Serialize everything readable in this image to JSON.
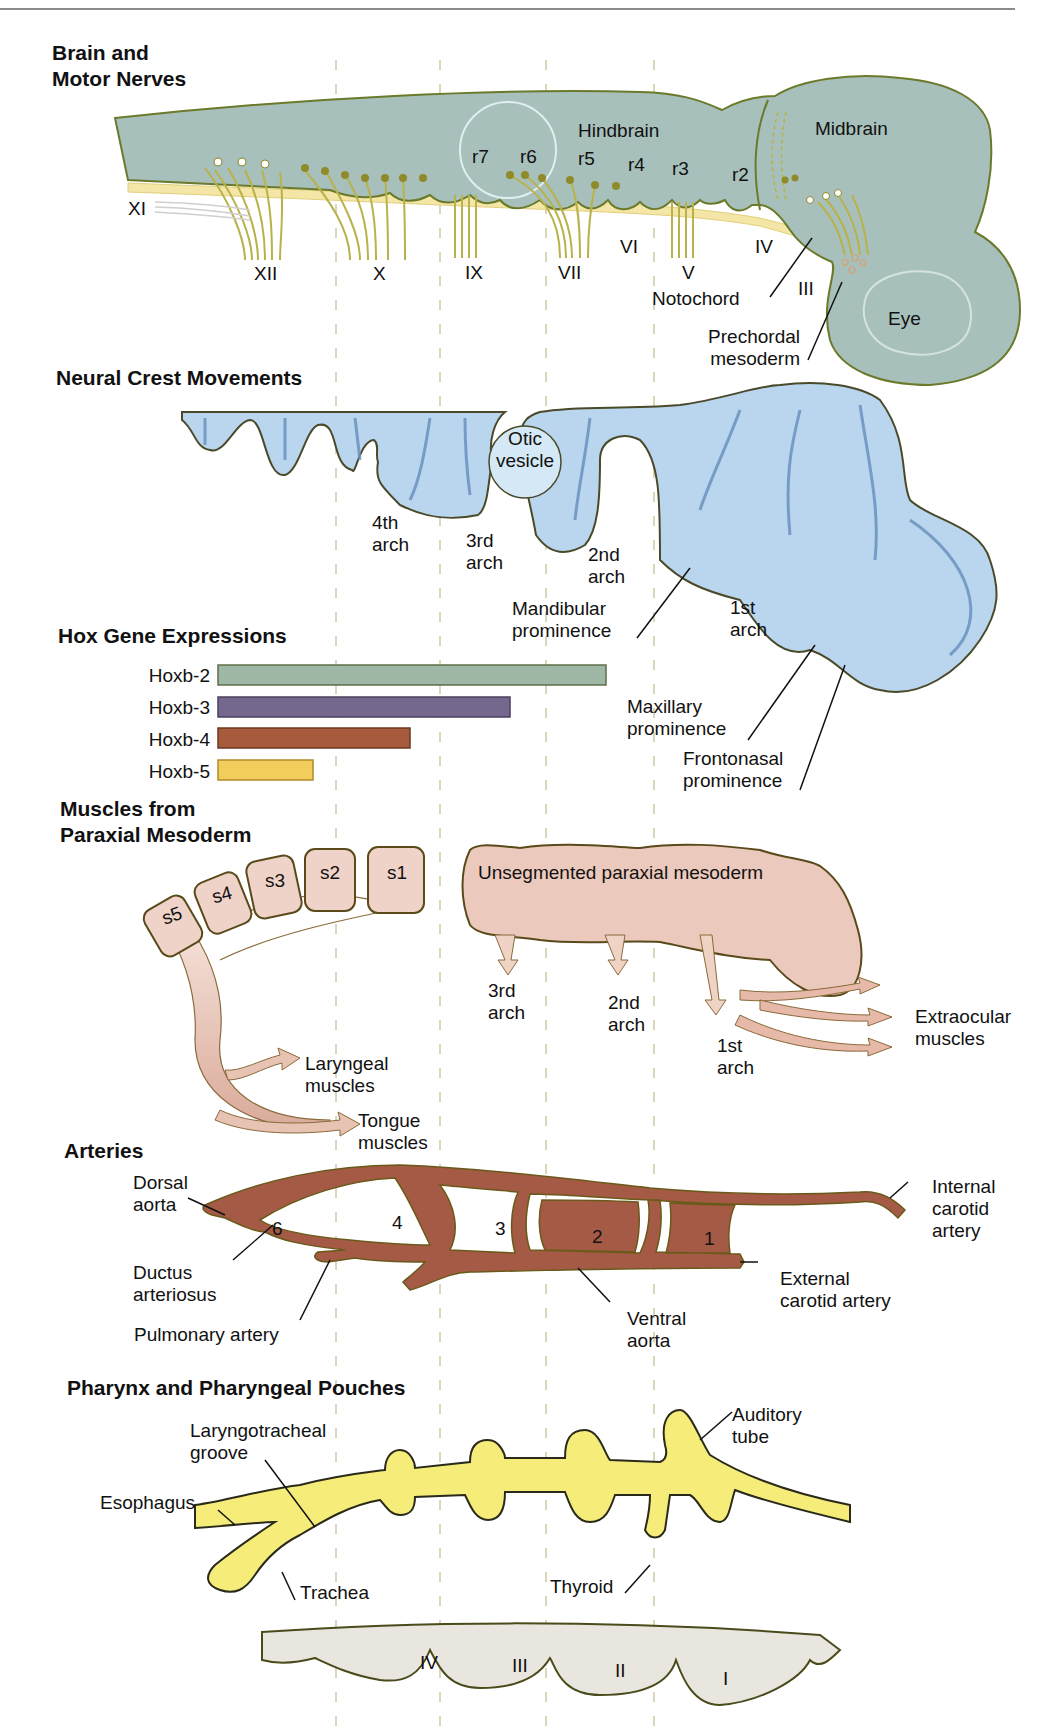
{
  "colors": {
    "brain": "#a8c0bb",
    "brain_outline": "#6a7a2a",
    "nerve": "#b9b24a",
    "notochord": "#f3e6a6",
    "neural_crest": "#b9d6ee",
    "neural_crest_arrow": "#7fa9d6",
    "mesoderm": "#ecc9bd",
    "artery": "#a45a45",
    "pharynx": "#f5ec7a",
    "ectoderm": "#e9e6df",
    "guide_line": "#c9c3a0",
    "hox_b2": "#9fb8a6",
    "hox_b3": "#75688f",
    "hox_b4": "#a85a3c",
    "hox_b5": "#f1cd5c"
  },
  "sections": {
    "brain": {
      "title_line1": "Brain and",
      "title_line2": "Motor Nerves",
      "hindbrain": "Hindbrain",
      "midbrain": "Midbrain",
      "eye": "Eye",
      "rhombomeres": [
        "r7",
        "r6",
        "r5",
        "r4",
        "r3",
        "r2"
      ],
      "nerves": [
        "XI",
        "XII",
        "X",
        "IX",
        "VII",
        "VI",
        "V",
        "IV",
        "III"
      ],
      "notochord": "Notochord",
      "prechordal_line1": "Prechordal",
      "prechordal_line2": "mesoderm"
    },
    "neural_crest": {
      "title": "Neural Crest Movements",
      "otic_line1": "Otic",
      "otic_line2": "vesicle",
      "arch4_line1": "4th",
      "arch4_line2": "arch",
      "arch3_line1": "3rd",
      "arch3_line2": "arch",
      "arch2_line1": "2nd",
      "arch2_line2": "arch",
      "arch1_line1": "1st",
      "arch1_line2": "arch",
      "mandibular_line1": "Mandibular",
      "mandibular_line2": "prominence",
      "maxillary_line1": "Maxillary",
      "maxillary_line2": "prominence",
      "frontonasal_line1": "Frontonasal",
      "frontonasal_line2": "prominence"
    },
    "hox": {
      "title": "Hox Gene Expressions",
      "genes": [
        {
          "name": "Hoxb-2",
          "start_x": 218,
          "end_x": 606
        },
        {
          "name": "Hoxb-3",
          "start_x": 218,
          "end_x": 510
        },
        {
          "name": "Hoxb-4",
          "start_x": 218,
          "end_x": 410
        },
        {
          "name": "Hoxb-5",
          "start_x": 218,
          "end_x": 313
        }
      ]
    },
    "muscles": {
      "title_line1": "Muscles from",
      "title_line2": "Paraxial Mesoderm",
      "somites": [
        "s5",
        "s4",
        "s3",
        "s2",
        "s1"
      ],
      "unsegmented": "Unsegmented paraxial mesoderm",
      "arch3_line1": "3rd",
      "arch3_line2": "arch",
      "arch2_line1": "2nd",
      "arch2_line2": "arch",
      "arch1_line1": "1st",
      "arch1_line2": "arch",
      "laryngeal_line1": "Laryngeal",
      "laryngeal_line2": "muscles",
      "tongue_line1": "Tongue",
      "tongue_line2": "muscles",
      "extraocular_line1": "Extraocular",
      "extraocular_line2": "muscles"
    },
    "arteries": {
      "title": "Arteries",
      "dorsal_line1": "Dorsal",
      "dorsal_line2": "aorta",
      "ductus_line1": "Ductus",
      "ductus_line2": "arteriosus",
      "pulmonary": "Pulmonary artery",
      "arch_numbers": [
        "6",
        "4",
        "3",
        "2",
        "1"
      ],
      "ventral_line1": "Ventral",
      "ventral_line2": "aorta",
      "external_line1": "External",
      "external_line2": "carotid artery",
      "internal_line1": "Internal",
      "internal_line2": "carotid",
      "internal_line3": "artery"
    },
    "pharynx": {
      "title": "Pharynx and Pharyngeal Pouches",
      "laryngo_line1": "Laryngotracheal",
      "laryngo_line2": "groove",
      "esophagus": "Esophagus",
      "trachea": "Trachea",
      "thyroid": "Thyroid",
      "auditory_line1": "Auditory",
      "auditory_line2": "tube",
      "clefts": [
        "IV",
        "III",
        "II",
        "I"
      ]
    }
  }
}
